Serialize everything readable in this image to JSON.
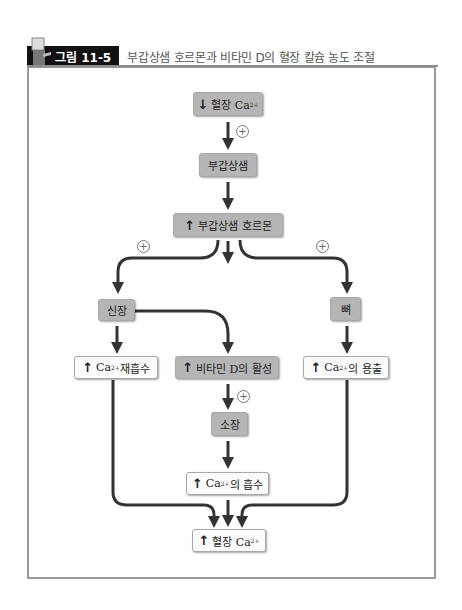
{
  "header": {
    "figure_label": "그림 11-5",
    "title": "부갑상샘 호르몬과 비타민 D의 혈장 칼슘 농도 조절"
  },
  "nodes": {
    "low_plasma_ca": {
      "arrow": "down",
      "text": "혈장 Ca",
      "sup": "2+"
    },
    "parathyroid": {
      "text": "부갑상샘"
    },
    "pth_up": {
      "arrow": "up",
      "text": "부갑상샘 호르몬"
    },
    "kidney": {
      "text": "신장"
    },
    "bone": {
      "text": "뼈"
    },
    "ca_reabsorption": {
      "arrow": "up",
      "text": "Ca",
      "sup": "2+",
      "suffix": " 재흡수"
    },
    "vitd_activation": {
      "arrow": "up",
      "text": "비타민 D의 활성"
    },
    "ca_release": {
      "arrow": "up",
      "text": "Ca",
      "sup": "2+",
      "suffix": "의 용출"
    },
    "small_intestine": {
      "text": "소장"
    },
    "ca_absorption": {
      "arrow": "up",
      "text": "Ca",
      "sup": "2+",
      "suffix": "의 흡수"
    },
    "high_plasma_ca": {
      "arrow": "up",
      "text": "혈장 Ca",
      "sup": "2+"
    }
  },
  "symbols": {
    "plus": "+",
    "up_arrow": "↑",
    "down_arrow": "↓"
  },
  "colors": {
    "gray_node": "#b5b5b5",
    "white_node": "#fbfbfb",
    "arrow": "#333333",
    "frame": "#9a9a9a"
  }
}
